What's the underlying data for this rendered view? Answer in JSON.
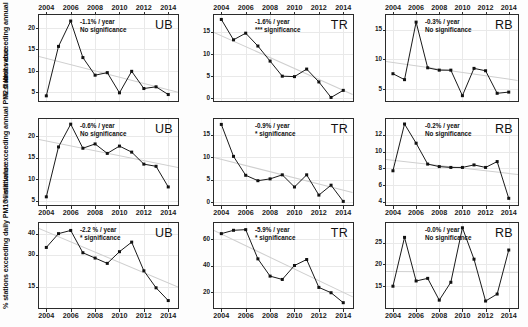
{
  "figure": {
    "row_axis_titles": [
      "% stations exceeding\nannual PM10 limit value",
      "% stations exceeding\nannual PM2.5 limit value",
      "% stations exceeding\ndaily PM10 limit value"
    ],
    "years": [
      2004,
      2005,
      2006,
      2007,
      2008,
      2009,
      2010,
      2011,
      2012,
      2013,
      2014
    ],
    "xtick_labels": [
      "2004",
      "2006",
      "2008",
      "2010",
      "2012",
      "2014"
    ],
    "xtick_values": [
      2004,
      2006,
      2008,
      2010,
      2012,
      2014
    ],
    "station_types": [
      "UB",
      "TR",
      "RB"
    ],
    "line_color": "#1a1a1a",
    "marker_color": "#111111",
    "trend_color": "#cfcfcf",
    "grid_color": "#e9e9e9"
  },
  "chart_data": [
    {
      "type": "line",
      "panel_id": "r1c1",
      "title": "UB",
      "ylabel": "% stations exceeding annual PM10 limit value",
      "xlabel": "",
      "x": [
        2004,
        2005,
        2006,
        2007,
        2008,
        2009,
        2010,
        2011,
        2012,
        2013,
        2014
      ],
      "values": [
        4.2,
        15.7,
        21.6,
        13.1,
        9.0,
        9.6,
        4.9,
        9.9,
        5.9,
        6.3,
        4.5
      ],
      "ylim": [
        3.0,
        23.0
      ],
      "yticks": [
        5,
        10,
        15,
        20
      ],
      "ytick_labels": [
        "5",
        "10",
        "15",
        "20"
      ],
      "xlim": [
        2003.4,
        2014.8
      ],
      "grid": true,
      "trend_label": "-1.1% / year",
      "significance_label": "No significance",
      "trend_start": 13.5,
      "trend_end": 5.2
    },
    {
      "type": "line",
      "panel_id": "r1c2",
      "title": "TR",
      "ylabel": "",
      "xlabel": "",
      "x": [
        2004,
        2005,
        2006,
        2007,
        2008,
        2009,
        2010,
        2011,
        2012,
        2013,
        2014
      ],
      "values": [
        17.8,
        13.2,
        14.7,
        11.8,
        8.4,
        5.0,
        4.9,
        6.6,
        3.7,
        0.2,
        1.8
      ],
      "ylim": [
        -0.6,
        18.8
      ],
      "yticks": [
        0,
        5,
        10,
        15
      ],
      "ytick_labels": [
        "0",
        "5",
        "10",
        "15"
      ],
      "xlim": [
        2003.4,
        2014.8
      ],
      "grid": true,
      "trend_label": "-1.6% / year",
      "significance_label": "*** significance",
      "trend_start": 15.0,
      "trend_end": 1.0
    },
    {
      "type": "line",
      "panel_id": "r1c3",
      "title": "RB",
      "ylabel": "",
      "xlabel": "",
      "x": [
        2004,
        2005,
        2006,
        2007,
        2008,
        2009,
        2010,
        2011,
        2012,
        2013,
        2014
      ],
      "values": [
        7.6,
        6.6,
        16.3,
        8.6,
        8.2,
        8.2,
        3.9,
        8.5,
        8.1,
        4.3,
        4.5
      ],
      "ylim": [
        3.0,
        17.5
      ],
      "yticks": [
        5,
        10,
        15
      ],
      "ytick_labels": [
        "5",
        "10",
        "15"
      ],
      "xlim": [
        2003.4,
        2014.8
      ],
      "grid": true,
      "trend_label": "-0.3% / year",
      "significance_label": "No significance",
      "trend_start": 9.8,
      "trend_end": 6.6
    },
    {
      "type": "line",
      "panel_id": "r2c1",
      "title": "UB",
      "ylabel": "% stations exceeding annual PM2.5 limit value",
      "xlabel": "",
      "x": [
        2004,
        2005,
        2006,
        2007,
        2008,
        2009,
        2010,
        2011,
        2012,
        2013,
        2014
      ],
      "values": [
        5.9,
        17.5,
        22.8,
        17.2,
        18.2,
        16.0,
        17.7,
        16.3,
        13.5,
        13.0,
        8.2
      ],
      "ylim": [
        4.0,
        24.0
      ],
      "yticks": [
        5,
        10,
        15,
        20
      ],
      "ytick_labels": [
        "5",
        "10",
        "15",
        "20"
      ],
      "xlim": [
        2003.4,
        2014.8
      ],
      "grid": true,
      "trend_label": "-0.6% / year",
      "significance_label": "No significance",
      "trend_start": 19.3,
      "trend_end": 12.8
    },
    {
      "type": "line",
      "panel_id": "r2c2",
      "title": "TR",
      "ylabel": "",
      "xlabel": "",
      "x": [
        2004,
        2005,
        2006,
        2007,
        2008,
        2009,
        2010,
        2011,
        2012,
        2013,
        2014
      ],
      "values": [
        17.3,
        10.2,
        6.0,
        4.8,
        5.2,
        6.1,
        3.4,
        6.1,
        1.6,
        3.8,
        0.2
      ],
      "ylim": [
        -0.6,
        18.5
      ],
      "yticks": [
        0,
        5,
        10,
        15
      ],
      "ytick_labels": [
        "0",
        "5",
        "10",
        "15"
      ],
      "xlim": [
        2003.4,
        2014.8
      ],
      "grid": true,
      "trend_label": "-0.9% / year",
      "significance_label": "* significance",
      "trend_start": 10.0,
      "trend_end": 2.2
    },
    {
      "type": "line",
      "panel_id": "r2c3",
      "title": "RB",
      "ylabel": "",
      "xlabel": "",
      "x": [
        2004,
        2005,
        2006,
        2007,
        2008,
        2009,
        2010,
        2011,
        2012,
        2013,
        2014
      ],
      "values": [
        7.7,
        13.3,
        11.0,
        8.5,
        8.2,
        8.1,
        8.1,
        8.4,
        8.1,
        8.8,
        4.4
      ],
      "ylim": [
        3.6,
        13.9
      ],
      "yticks": [
        4,
        6,
        8,
        10,
        12
      ],
      "ytick_labels": [
        "4",
        "6",
        "8",
        "10",
        "12"
      ],
      "xlim": [
        2003.4,
        2014.8
      ],
      "grid": true,
      "trend_label": "-0.2% / year",
      "significance_label": "No significance",
      "trend_start": 9.1,
      "trend_end": 7.3
    },
    {
      "type": "line",
      "panel_id": "r3c1",
      "title": "UB",
      "ylabel": "% stations exceeding daily PM10 limit value",
      "xlabel": "",
      "x": [
        2004,
        2005,
        2006,
        2007,
        2008,
        2009,
        2010,
        2011,
        2012,
        2013,
        2014
      ],
      "values": [
        33.5,
        40.0,
        41.5,
        31.0,
        28.5,
        26.0,
        31.5,
        36.0,
        22.5,
        14.5,
        8.5
      ],
      "ylim": [
        5.0,
        45.0
      ],
      "yticks": [
        15,
        30,
        40
      ],
      "ytick_labels": [
        "15",
        "30",
        "40"
      ],
      "xlim": [
        2003.4,
        2014.8
      ],
      "grid": true,
      "trend_label": "-2.2 % / year",
      "significance_label": "* significance",
      "trend_start": 42.5,
      "trend_end": 15.0
    },
    {
      "type": "line",
      "panel_id": "r3c2",
      "title": "TR",
      "ylabel": "",
      "xlabel": "",
      "x": [
        2004,
        2005,
        2006,
        2007,
        2008,
        2009,
        2010,
        2011,
        2012,
        2013,
        2014
      ],
      "values": [
        64.0,
        66.5,
        67.0,
        45.0,
        32.0,
        29.5,
        40.0,
        44.5,
        23.5,
        19.5,
        12.0
      ],
      "ylim": [
        8.0,
        72.0
      ],
      "yticks": [
        20,
        40,
        60
      ],
      "ytick_labels": [
        "20",
        "40",
        "60"
      ],
      "xlim": [
        2003.4,
        2014.8
      ],
      "grid": true,
      "trend_label": "-5.9% / year",
      "significance_label": "* significance",
      "trend_start": 67.0,
      "trend_end": 17.0
    },
    {
      "type": "line",
      "panel_id": "r3c3",
      "title": "RB",
      "ylabel": "",
      "xlabel": "",
      "x": [
        2004,
        2005,
        2006,
        2007,
        2008,
        2009,
        2010,
        2011,
        2012,
        2013,
        2014
      ],
      "values": [
        15.0,
        26.2,
        16.2,
        16.8,
        11.8,
        15.9,
        28.4,
        21.2,
        11.6,
        13.2,
        23.3
      ],
      "ylim": [
        10.0,
        29.5
      ],
      "yticks": [
        15,
        20,
        25
      ],
      "ytick_labels": [
        "15",
        "20",
        "25"
      ],
      "xlim": [
        2003.4,
        2014.8
      ],
      "grid": true,
      "trend_label": "-0.0% / year",
      "significance_label": "No significance",
      "trend_start": 18.6,
      "trend_end": 18.4
    }
  ]
}
